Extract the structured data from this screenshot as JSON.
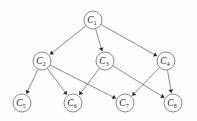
{
  "diagram": {
    "type": "directed-graph",
    "background_color": "#fdfdfd",
    "node_fill_color": "#ffffff",
    "node_stroke_color": "#555555",
    "edge_color": "#4a4a4a",
    "arrow_color": "#2b2b2b",
    "label_color": "#1d1d1d",
    "node_radius": 9,
    "nodes": [
      {
        "id": "C1",
        "base": "C",
        "sub": "1",
        "x": 93,
        "y": 20,
        "level": 0
      },
      {
        "id": "C2",
        "base": "C",
        "sub": "2",
        "x": 42,
        "y": 61,
        "level": 1
      },
      {
        "id": "C3",
        "base": "C",
        "sub": "3",
        "x": 105,
        "y": 61,
        "level": 1
      },
      {
        "id": "C4",
        "base": "C",
        "sub": "4",
        "x": 166,
        "y": 61,
        "level": 1
      },
      {
        "id": "C5",
        "base": "C",
        "sub": "5",
        "x": 22,
        "y": 103,
        "level": 2
      },
      {
        "id": "C6",
        "base": "C",
        "sub": "6",
        "x": 73,
        "y": 103,
        "level": 2
      },
      {
        "id": "C7",
        "base": "C",
        "sub": "7",
        "x": 125,
        "y": 103,
        "level": 2
      },
      {
        "id": "C8",
        "base": "C",
        "sub": "8",
        "x": 173,
        "y": 103,
        "level": 2
      }
    ],
    "edges": [
      {
        "from": "C1",
        "to": "C2"
      },
      {
        "from": "C1",
        "to": "C3"
      },
      {
        "from": "C1",
        "to": "C4"
      },
      {
        "from": "C2",
        "to": "C5"
      },
      {
        "from": "C2",
        "to": "C6"
      },
      {
        "from": "C2",
        "to": "C7"
      },
      {
        "from": "C3",
        "to": "C6"
      },
      {
        "from": "C3",
        "to": "C8"
      },
      {
        "from": "C4",
        "to": "C7"
      },
      {
        "from": "C4",
        "to": "C8"
      }
    ]
  }
}
